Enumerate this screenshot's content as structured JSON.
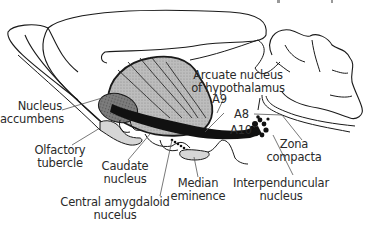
{
  "diagram": {
    "type": "anatomical-sagittal-brain-section",
    "structures": {
      "nucleus_accumbens": [
        "Nucleus",
        "accumbens"
      ],
      "olfactory_tubercle": [
        "Olfactory",
        "tubercle"
      ],
      "caudate_nucleus": [
        "Caudate",
        "nucleus"
      ],
      "central_amygdaloid": [
        "Central amygdaloid",
        "nucelus"
      ],
      "median_eminence": [
        "Median",
        "eminence"
      ],
      "interpeduncular": [
        "Interpenduncular",
        "nucleus"
      ],
      "zona_compacta": [
        "Zona",
        "compacta"
      ],
      "arcuate": [
        "Arcuate nucleus",
        "of hypothalamus"
      ],
      "a9": "A9",
      "a8": "A8",
      "a10": "A10"
    },
    "colors": {
      "outline": "#1a1a1a",
      "striatum_fill": "#b8b8b8",
      "accumbens_fill": "#7a7a7a",
      "pathway": "#111111",
      "tubercle_fill": "#d6d6d6",
      "leader_line": "#555555"
    }
  }
}
